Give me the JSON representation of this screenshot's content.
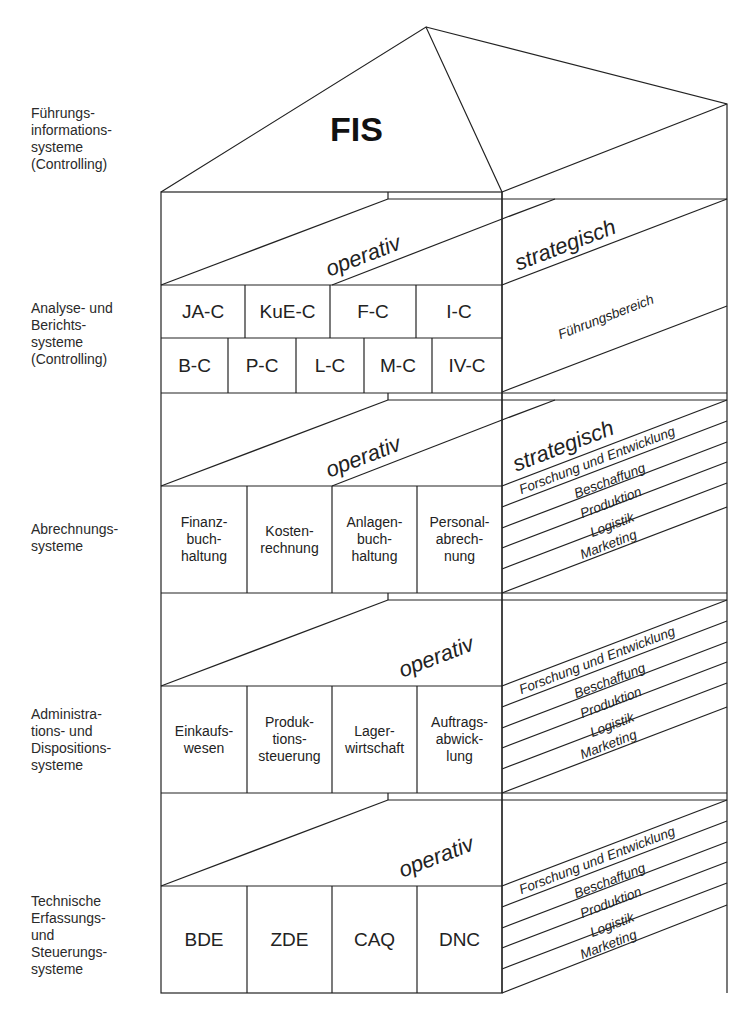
{
  "diagram": {
    "title": "FIS",
    "levels": [
      {
        "id": "fis",
        "label": "Führungs-\ninformations-\nsysteme\n(Controlling)"
      },
      {
        "id": "analyse",
        "label": "Analyse- und\nBerichts-\nsysteme\n(Controlling)"
      },
      {
        "id": "abrechnung",
        "label": "Abrechnungs-\nsysteme"
      },
      {
        "id": "admin",
        "label": "Administra-\ntions- und\nDispositions-\nsysteme"
      },
      {
        "id": "technisch",
        "label": "Technische\nErfassungs-\nund\nSteuerungs-\nsysteme"
      }
    ],
    "bands": {
      "operativ": "operativ",
      "strategisch": "strategisch",
      "fuehrungsbereich": "Führungsbereich"
    },
    "analyse_row1": [
      "JA-C",
      "KuE-C",
      "F-C",
      "I-C"
    ],
    "analyse_row2": [
      "B-C",
      "P-C",
      "L-C",
      "M-C",
      "IV-C"
    ],
    "abrechnung_cells": [
      "Finanz-\nbuch-\nhaltung",
      "Kosten-\nrechnung",
      "Anlagen-\nbuch-\nhaltung",
      "Personal-\nabrech-\nnung"
    ],
    "admin_cells": [
      "Einkaufs-\nwesen",
      "Produk-\ntions-\nsteuerung",
      "Lager-\nwirtschaft",
      "Auftrags-\nabwick-\nlung"
    ],
    "technisch_cells": [
      "BDE",
      "ZDE",
      "CAQ",
      "DNC"
    ],
    "functions": [
      "Forschung und Entwicklung",
      "Beschaffung",
      "Produktion",
      "Logistik",
      "Marketing"
    ]
  }
}
